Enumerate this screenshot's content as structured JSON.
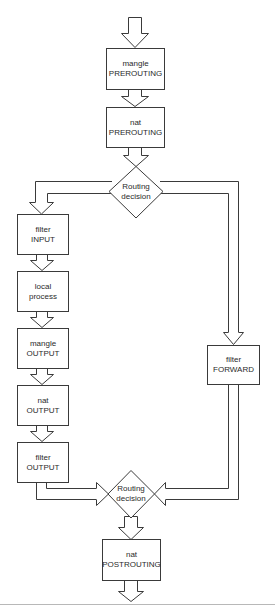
{
  "diagram": {
    "type": "flowchart",
    "colors": {
      "stroke": "#3a3a3a",
      "fill": "#ffffff",
      "text": "#2a2a2a",
      "separator": "#b8b8b8"
    },
    "nodes": {
      "mangle_prerouting": {
        "line1": "mangle",
        "line2": "PREROUTING"
      },
      "nat_prerouting": {
        "line1": "nat",
        "line2": "PREROUTING"
      },
      "routing_decision_1": {
        "line1": "Routing",
        "line2": "decision"
      },
      "filter_input": {
        "line1": "filter",
        "line2": "INPUT"
      },
      "local_process": {
        "line1": "local",
        "line2": "process"
      },
      "mangle_output": {
        "line1": "mangle",
        "line2": "OUTPUT"
      },
      "nat_output": {
        "line1": "nat",
        "line2": "OUTPUT"
      },
      "filter_output": {
        "line1": "filter",
        "line2": "OUTPUT"
      },
      "filter_forward": {
        "line1": "filter",
        "line2": "FORWARD"
      },
      "routing_decision_2": {
        "line1": "Routing",
        "line2": "decision"
      },
      "nat_postrouting": {
        "line1": "nat",
        "line2": "POSTROUTING"
      }
    },
    "edges": [
      {
        "from": "input",
        "to": "mangle_prerouting"
      },
      {
        "from": "mangle_prerouting",
        "to": "nat_prerouting"
      },
      {
        "from": "nat_prerouting",
        "to": "routing_decision_1"
      },
      {
        "from": "routing_decision_1",
        "to": "filter_input"
      },
      {
        "from": "routing_decision_1",
        "to": "filter_forward"
      },
      {
        "from": "filter_input",
        "to": "local_process"
      },
      {
        "from": "local_process",
        "to": "mangle_output"
      },
      {
        "from": "mangle_output",
        "to": "nat_output"
      },
      {
        "from": "nat_output",
        "to": "filter_output"
      },
      {
        "from": "filter_output",
        "to": "routing_decision_2"
      },
      {
        "from": "filter_forward",
        "to": "routing_decision_2"
      },
      {
        "from": "routing_decision_2",
        "to": "nat_postrouting"
      },
      {
        "from": "nat_postrouting",
        "to": "output"
      }
    ]
  }
}
